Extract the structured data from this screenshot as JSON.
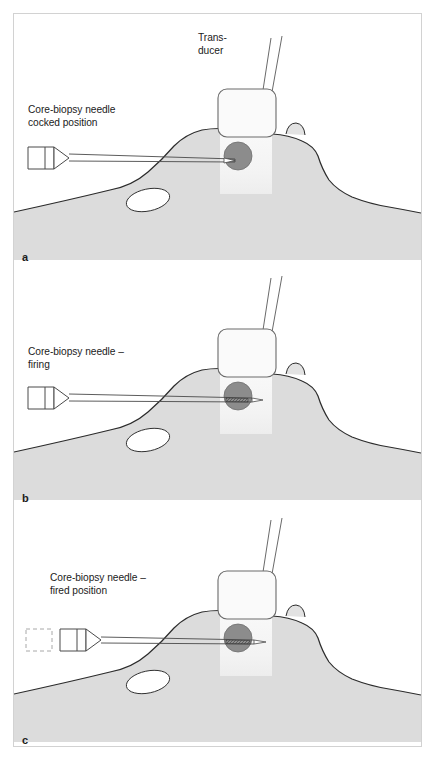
{
  "figure": {
    "title_visible": false,
    "panel_count": 3,
    "colors": {
      "outline": "#2b2b2b",
      "frame_border": "#d2d2d2",
      "breast_tissue": "#dcdcdc",
      "subcutaneous_fat": "#e4e4e4",
      "pectoral_muscle": "#b4b4b4",
      "lesion": "#8c8c8c",
      "beam": "#f7f7f7",
      "cyst": "#ffffff",
      "text": "#1b1b1b",
      "background": "#ffffff"
    }
  },
  "panels": [
    {
      "letter": "a",
      "caption": "Core-biopsy needle\ncocked position",
      "transducer_label": "Trans-\nducer",
      "state": "cocked",
      "needle_tip_position": "adjacent to lesion",
      "ghost_hub_visible": false
    },
    {
      "letter": "b",
      "caption": "Core-biopsy needle –\nfiring",
      "transducer_label": "",
      "state": "firing",
      "needle_tip_position": "through lesion",
      "ghost_hub_visible": false
    },
    {
      "letter": "c",
      "caption": "Core-biopsy needle –\nfired position",
      "transducer_label": "",
      "state": "fired",
      "needle_tip_position": "past lesion",
      "ghost_hub_visible": true
    }
  ],
  "anatomy": {
    "lesion_label": "lesion",
    "nipple_label": "nipple",
    "cyst_label": "cyst",
    "muscle_label": "pectoral muscle"
  },
  "icons": {
    "transducer": "transducer-icon",
    "needle": "biopsy-needle-icon",
    "lesion": "lesion-icon",
    "cable": "transducer-cable-icon"
  }
}
